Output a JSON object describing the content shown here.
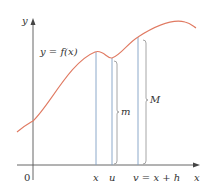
{
  "diagram": {
    "axes": {
      "x_label": "x",
      "y_label": "y",
      "origin_label": "0"
    },
    "curve": {
      "label": "y = f(x)",
      "color": "#e07a62"
    },
    "markers": [
      {
        "id": "x",
        "label": "x"
      },
      {
        "id": "u",
        "label": "u"
      },
      {
        "id": "v",
        "label": "v = x + h"
      }
    ],
    "brackets": [
      {
        "id": "m",
        "label": "m"
      },
      {
        "id": "M",
        "label": "M"
      }
    ],
    "colors": {
      "axis": "#555555",
      "vertical_line": "#7f9fc4",
      "bracket": "#8f8f8f",
      "text": "#333333"
    }
  }
}
